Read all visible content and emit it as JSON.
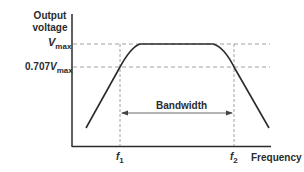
{
  "diagram": {
    "type": "frequency response curve",
    "y_axis_label_line1": "Output",
    "y_axis_label_line2": "voltage",
    "x_axis_label": "Frequency",
    "vmax_label": {
      "main": "V",
      "sub": "max"
    },
    "v707_label": {
      "prefix": "0.707",
      "main": "V",
      "sub": "max"
    },
    "f1_label": {
      "main": "f",
      "sub": "1"
    },
    "f2_label": {
      "main": "f",
      "sub": "2"
    },
    "bandwidth_label": "Bandwidth",
    "colors": {
      "curve": "#2b2b2b",
      "axis": "#2b2b2b",
      "dashed": "#888888"
    }
  }
}
